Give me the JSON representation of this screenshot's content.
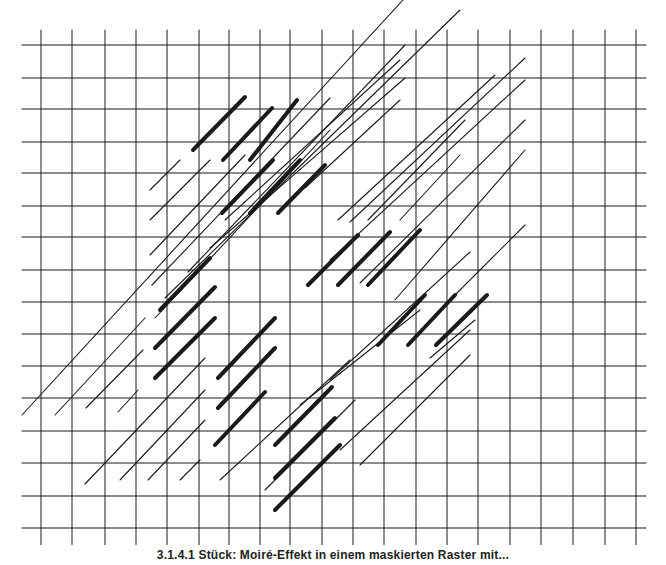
{
  "figure": {
    "grid": {
      "vertical_x": [
        41,
        72,
        105,
        136,
        167,
        199,
        229,
        260,
        290,
        322,
        353,
        384,
        416,
        447,
        478,
        510,
        541,
        573,
        605,
        636
      ],
      "horizontal_y": [
        45,
        78,
        109,
        142,
        173,
        206,
        237,
        270,
        302,
        334,
        366,
        398,
        431,
        463,
        496,
        528
      ],
      "x_start": 22,
      "x_end": 646,
      "y_start": 30,
      "y_end": 548,
      "color": "#1a1a1a"
    },
    "segments_thin": [
      [
        22,
        415,
        403,
        0
      ],
      [
        55,
        415,
        145,
        318
      ],
      [
        86,
        408,
        143,
        350
      ],
      [
        118,
        412,
        138,
        390
      ],
      [
        85,
        484,
        205,
        358
      ],
      [
        120,
        480,
        205,
        390
      ],
      [
        148,
        480,
        205,
        420
      ],
      [
        180,
        480,
        200,
        460
      ],
      [
        150,
        190,
        180,
        160
      ],
      [
        150,
        220,
        210,
        160
      ],
      [
        150,
        255,
        245,
        155
      ],
      [
        152,
        285,
        330,
        98
      ],
      [
        155,
        318,
        330,
        130
      ],
      [
        165,
        298,
        460,
        10
      ],
      [
        188,
        272,
        405,
        45
      ],
      [
        210,
        248,
        405,
        78
      ],
      [
        225,
        220,
        400,
        60
      ],
      [
        305,
        188,
        400,
        100
      ],
      [
        338,
        220,
        495,
        75
      ],
      [
        350,
        222,
        525,
        58
      ],
      [
        368,
        220,
        465,
        120
      ],
      [
        400,
        220,
        460,
        155
      ],
      [
        330,
        260,
        525,
        80
      ],
      [
        360,
        283,
        525,
        120
      ],
      [
        395,
        300,
        525,
        150
      ],
      [
        435,
        315,
        525,
        225
      ],
      [
        330,
        380,
        470,
        252
      ],
      [
        300,
        405,
        420,
        310
      ],
      [
        340,
        450,
        470,
        330
      ],
      [
        360,
        465,
        470,
        355
      ],
      [
        430,
        358,
        475,
        320
      ],
      [
        220,
        480,
        350,
        360
      ],
      [
        265,
        490,
        355,
        400
      ]
    ],
    "segments_thick": [
      [
        193,
        150,
        245,
        97
      ],
      [
        223,
        160,
        272,
        108
      ],
      [
        250,
        160,
        297,
        100
      ],
      [
        222,
        213,
        273,
        160
      ],
      [
        250,
        213,
        300,
        160
      ],
      [
        278,
        213,
        325,
        165
      ],
      [
        160,
        310,
        210,
        258
      ],
      [
        155,
        348,
        215,
        287
      ],
      [
        155,
        378,
        215,
        318
      ],
      [
        218,
        378,
        275,
        318
      ],
      [
        218,
        408,
        275,
        348
      ],
      [
        215,
        445,
        265,
        392
      ],
      [
        308,
        285,
        358,
        235
      ],
      [
        338,
        285,
        390,
        232
      ],
      [
        368,
        285,
        420,
        230
      ],
      [
        378,
        345,
        425,
        295
      ],
      [
        408,
        345,
        455,
        295
      ],
      [
        436,
        345,
        487,
        295
      ],
      [
        275,
        445,
        332,
        387
      ],
      [
        275,
        478,
        335,
        418
      ],
      [
        275,
        510,
        340,
        445
      ]
    ]
  },
  "caption": "3.1.4.1 Stück: Moiré-Effekt in einem maskierten Raster mit..."
}
